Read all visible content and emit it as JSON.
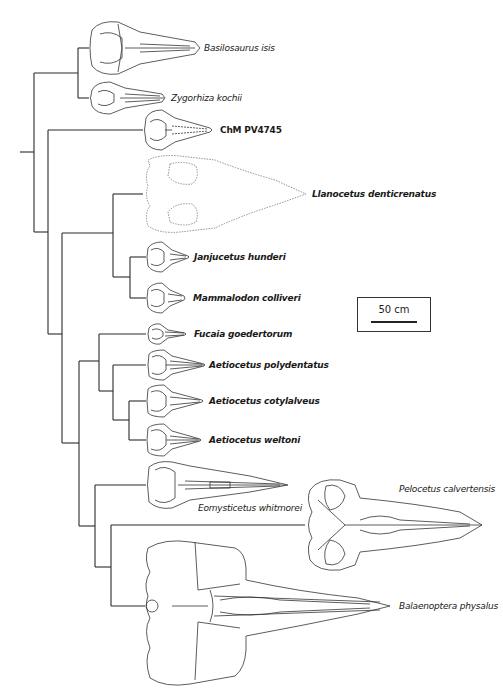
{
  "figure": {
    "type": "phylogenetic-tree"
  },
  "taxa": [
    {
      "id": "basilosaurus",
      "label": "Basilosaurus isis",
      "style": "italic",
      "y": 48
    },
    {
      "id": "zygorhiza",
      "label": "Zygorhiza kochii",
      "style": "italic",
      "y": 98
    },
    {
      "id": "chm",
      "label": "ChM PV4745",
      "style": "bold",
      "y": 130
    },
    {
      "id": "llanocetus",
      "label": "Llanocetus denticrenatus",
      "style": "bold-italic",
      "y": 194
    },
    {
      "id": "janjucetus",
      "label": "Janjucetus hunderi",
      "style": "bold-italic",
      "y": 257
    },
    {
      "id": "mammalodon",
      "label": "Mammalodon colliveri",
      "style": "bold-italic",
      "y": 298
    },
    {
      "id": "fucaia",
      "label": "Fucaia goedertorum",
      "style": "bold-italic",
      "y": 334
    },
    {
      "id": "aetio_poly",
      "label": "Aetiocetus polydentatus",
      "style": "bold-italic",
      "y": 365
    },
    {
      "id": "aetio_coty",
      "label": "Aetiocetus cotylalveus",
      "style": "bold-italic",
      "y": 401
    },
    {
      "id": "aetio_welt",
      "label": "Aetiocetus weltoni",
      "style": "bold-italic",
      "y": 440
    },
    {
      "id": "eomysticetus",
      "label": "Eomysticetus whitmorei",
      "style": "italic",
      "y": 485
    },
    {
      "id": "pelocetus",
      "label": "Pelocetus calvertensis",
      "style": "italic",
      "y": 525
    },
    {
      "id": "balaenoptera",
      "label": "Balaenoptera physalus",
      "style": "italic",
      "y": 606
    }
  ],
  "scale_bar": {
    "label": "50 cm"
  },
  "colors": {
    "line": "#2a2a2a",
    "skull_outline": "#333333",
    "background": "#ffffff"
  }
}
